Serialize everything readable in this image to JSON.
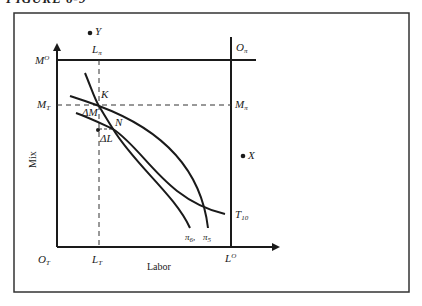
{
  "figure": {
    "heading": "FIGURE 6-9"
  },
  "axes": {
    "x_title": "Labor",
    "y_title": "Mix"
  },
  "labels": {
    "origin_T": {
      "main": "O",
      "sub": "T"
    },
    "origin_pi": {
      "main": "O",
      "sub": "π"
    },
    "L_T": {
      "main": "L",
      "sub": "T"
    },
    "L_pi": {
      "main": "L",
      "sub": "π"
    },
    "L_O": {
      "main": "L",
      "sup": "O"
    },
    "M_O": {
      "main": "M",
      "sup": "O"
    },
    "M_T": {
      "main": "M",
      "sub": "T"
    },
    "M_pi": {
      "main": "M",
      "sub": "π"
    },
    "K": "K",
    "N": "N",
    "delta_M": "ΔM",
    "delta_L": "ΔL",
    "X": "X",
    "Y": "Y",
    "T10": {
      "main": "T",
      "sub": "10"
    },
    "pi6": {
      "main": "π",
      "sub": "6"
    },
    "pi5": {
      "main": "π",
      "sub": "5"
    }
  },
  "colors": {
    "ink": "#1a1a1a",
    "background": "#ffffff"
  }
}
